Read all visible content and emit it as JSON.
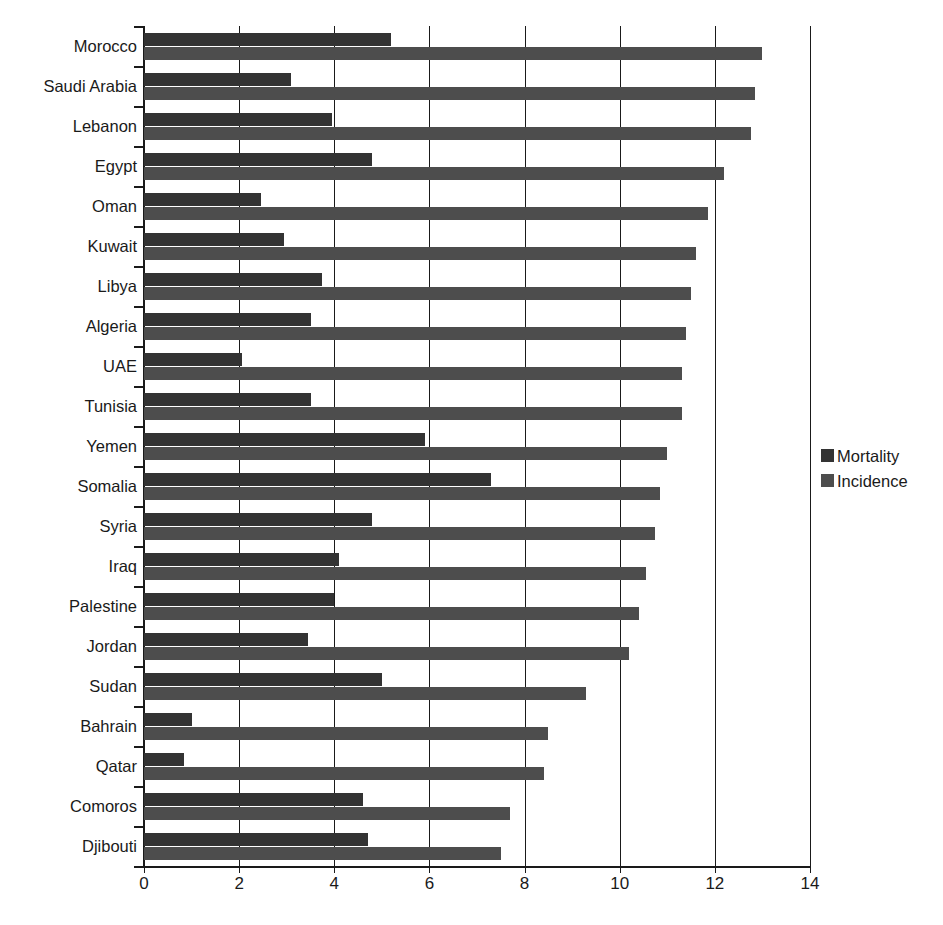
{
  "chart_data": {
    "type": "bar",
    "orientation": "horizontal",
    "title": "",
    "subtitle": "",
    "xlabel": "",
    "ylabel": "",
    "xlim": [
      0,
      14
    ],
    "xticks": [
      0,
      2,
      4,
      6,
      8,
      10,
      12,
      14
    ],
    "xtick_labels": [
      "0",
      "2",
      "4",
      "6",
      "8",
      "10",
      "12",
      "14"
    ],
    "grid": true,
    "grid_axis": "x",
    "legend_position": "right",
    "categories": [
      "Morocco",
      "Saudi Arabia",
      "Lebanon",
      "Egypt",
      "Oman",
      "Kuwait",
      "Libya",
      "Algeria",
      "UAE",
      "Tunisia",
      "Yemen",
      "Somalia",
      "Syria",
      "Iraq",
      "Palestine",
      "Jordan",
      "Sudan",
      "Bahrain",
      "Qatar",
      "Comoros",
      "Djibouti"
    ],
    "series": [
      {
        "name": "Mortality",
        "color": "#333333",
        "values": [
          5.2,
          3.1,
          3.95,
          4.8,
          2.45,
          2.95,
          3.75,
          3.5,
          2.05,
          3.5,
          5.9,
          7.3,
          4.8,
          4.1,
          4.0,
          3.45,
          5.0,
          1.0,
          0.85,
          4.6,
          4.7
        ]
      },
      {
        "name": "Incidence",
        "color": "#4d4d4d",
        "values": [
          13.0,
          12.85,
          12.75,
          12.2,
          11.85,
          11.6,
          11.5,
          11.4,
          11.3,
          11.3,
          11.0,
          10.85,
          10.75,
          10.55,
          10.4,
          10.2,
          9.3,
          8.5,
          8.4,
          7.7,
          7.5
        ]
      }
    ]
  },
  "legend": {
    "items": [
      {
        "label": "Mortality",
        "swatch": "mortality-swatch"
      },
      {
        "label": "Incidence",
        "swatch": "incidence-swatch"
      }
    ]
  }
}
